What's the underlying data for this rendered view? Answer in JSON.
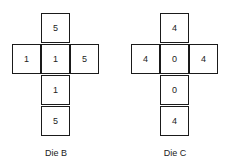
{
  "dice": [
    {
      "label": "Die B",
      "faces": {
        "top": "5",
        "left": "1",
        "center": "1",
        "right": "5",
        "below": "1",
        "bottom": "5"
      }
    },
    {
      "label": "Die C",
      "faces": {
        "top": "4",
        "left": "4",
        "center": "0",
        "right": "4",
        "below": "0",
        "bottom": "4"
      }
    }
  ]
}
